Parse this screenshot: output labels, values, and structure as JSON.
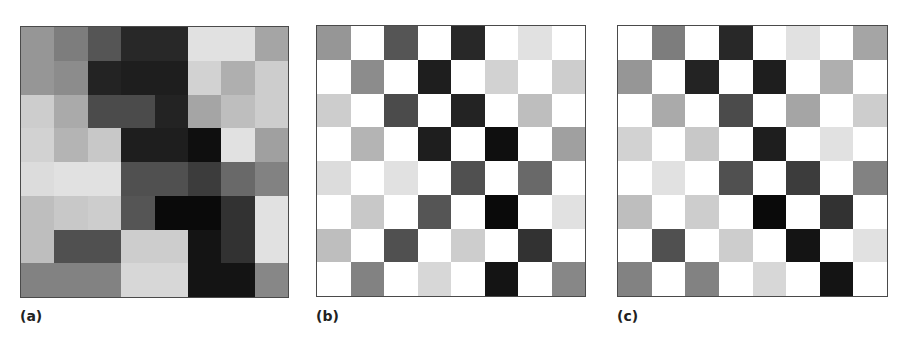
{
  "figure": {
    "panels": [
      {
        "id": "a",
        "label": "(a)",
        "description": "full 8x8 grayscale matrix"
      },
      {
        "id": "b",
        "label": "(b)",
        "description": "checkerboard mask: cells where (row+col) is even keep values, odd cells white"
      },
      {
        "id": "c",
        "label": "(c)",
        "description": "complementary mask: cells where (row+col) is odd keep values, even cells white"
      }
    ],
    "grid_size": 8,
    "white_value": 255,
    "border_color": "#4a4a4a"
  },
  "chart_data": [
    {
      "type": "heatmap",
      "title": "(a)",
      "colormap": "gray",
      "rows": 8,
      "cols": 8,
      "values": [
        [
          150,
          125,
          85,
          40,
          40,
          225,
          225,
          165
        ],
        [
          150,
          140,
          35,
          30,
          30,
          210,
          175,
          205
        ],
        [
          205,
          170,
          75,
          75,
          35,
          165,
          190,
          205
        ],
        [
          210,
          180,
          200,
          30,
          30,
          15,
          225,
          160
        ],
        [
          220,
          225,
          225,
          80,
          80,
          60,
          105,
          130
        ],
        [
          190,
          200,
          205,
          85,
          10,
          10,
          50,
          225
        ],
        [
          190,
          80,
          80,
          205,
          205,
          20,
          50,
          225
        ],
        [
          130,
          130,
          130,
          215,
          215,
          20,
          20,
          135
        ]
      ]
    },
    {
      "type": "heatmap",
      "title": "(b)",
      "colormap": "gray",
      "rows": 8,
      "cols": 8,
      "mask": "even",
      "values": [
        [
          150,
          255,
          85,
          255,
          40,
          255,
          225,
          255
        ],
        [
          255,
          140,
          255,
          30,
          255,
          210,
          255,
          205
        ],
        [
          205,
          255,
          75,
          255,
          35,
          255,
          190,
          255
        ],
        [
          255,
          180,
          255,
          30,
          255,
          15,
          255,
          160
        ],
        [
          220,
          255,
          225,
          255,
          80,
          255,
          105,
          255
        ],
        [
          255,
          200,
          255,
          85,
          255,
          10,
          255,
          225
        ],
        [
          190,
          255,
          80,
          255,
          205,
          255,
          50,
          255
        ],
        [
          255,
          130,
          255,
          215,
          255,
          20,
          255,
          135
        ]
      ]
    },
    {
      "type": "heatmap",
      "title": "(c)",
      "colormap": "gray",
      "rows": 8,
      "cols": 8,
      "mask": "odd",
      "values": [
        [
          255,
          125,
          255,
          40,
          255,
          225,
          255,
          165
        ],
        [
          150,
          255,
          35,
          255,
          30,
          255,
          175,
          255
        ],
        [
          255,
          170,
          255,
          75,
          255,
          165,
          255,
          205
        ],
        [
          210,
          255,
          200,
          255,
          30,
          255,
          225,
          255
        ],
        [
          255,
          225,
          255,
          80,
          255,
          60,
          255,
          130
        ],
        [
          190,
          255,
          205,
          255,
          10,
          255,
          50,
          255
        ],
        [
          255,
          80,
          255,
          205,
          255,
          20,
          255,
          225
        ],
        [
          130,
          255,
          130,
          255,
          215,
          255,
          20,
          255
        ]
      ]
    }
  ]
}
